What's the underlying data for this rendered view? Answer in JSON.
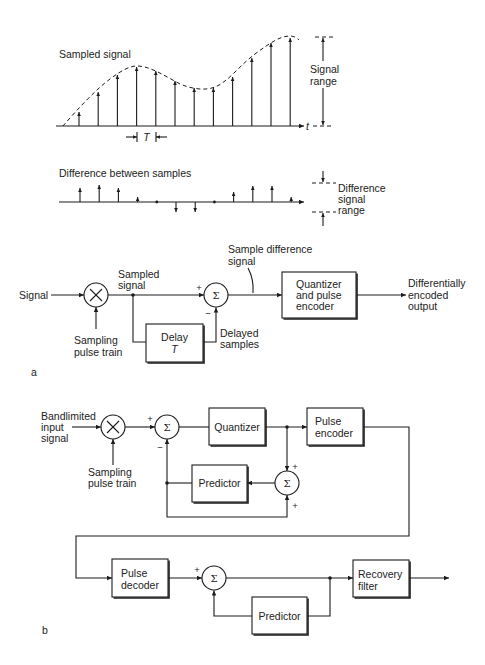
{
  "panel_a": {
    "label": "a",
    "sampled_waveform": {
      "title": "Sampled signal",
      "time_axis": "t",
      "period": "T",
      "range_label": [
        "Signal",
        "range"
      ],
      "sample_amplitudes": [
        14,
        34,
        51,
        59,
        55,
        45,
        38,
        38,
        49,
        68,
        83,
        88
      ]
    },
    "difference_waveform": {
      "title": "Difference between samples",
      "range_label": [
        "Difference",
        "signal",
        "range"
      ],
      "difference_amplitudes": [
        14,
        17,
        14,
        5,
        0,
        -10,
        -10,
        0,
        10,
        16,
        16,
        5
      ]
    },
    "block_diagram": {
      "input": "Signal",
      "sampling": [
        "Sampling",
        "pulse train"
      ],
      "sampled": [
        "Sampled",
        "signal"
      ],
      "summer": {
        "symbol": "Σ",
        "plus": "+",
        "minus": "−"
      },
      "difference": [
        "Sample difference",
        "signal"
      ],
      "delay_block": [
        "Delay",
        "T"
      ],
      "delayed": [
        "Delayed",
        "samples"
      ],
      "encoder_block": [
        "Quantizer",
        "and pulse",
        "encoder"
      ],
      "output": [
        "Differentially",
        "encoded",
        "output"
      ]
    }
  },
  "panel_b": {
    "label": "b",
    "input": [
      "Bandlimited",
      "input",
      "signal"
    ],
    "sampling": [
      "Sampling",
      "pulse train"
    ],
    "input_summer": {
      "symbol": "Σ",
      "plus": "+",
      "minus": "−"
    },
    "quantizer_block": "Quantizer",
    "encoder_block": [
      "Pulse",
      "encoder"
    ],
    "feedback_summer": {
      "symbol": "Σ",
      "plus_top": "+",
      "plus_bottom": "+"
    },
    "encoder_predictor_block": "Predictor",
    "decoder_block": [
      "Pulse",
      "decoder"
    ],
    "decoder_summer": {
      "symbol": "Σ",
      "plus": "+"
    },
    "decoder_predictor_block": "Predictor",
    "recovery_block": [
      "Recovery",
      "filter"
    ]
  }
}
